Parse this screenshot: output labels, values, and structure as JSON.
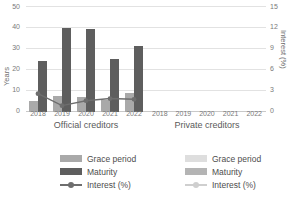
{
  "chart_data": {
    "type": "bar",
    "title": "",
    "subtitle": "",
    "xlabel": "",
    "ylabel": "Years",
    "y2label": "Interest (%)",
    "ylim": [
      0,
      50
    ],
    "y2lim": [
      0,
      15
    ],
    "yticks": [
      0,
      10,
      20,
      30,
      40,
      50
    ],
    "y2ticks": [
      0,
      3,
      6,
      9,
      12,
      15
    ],
    "grid": true,
    "legend_position": "bottom",
    "categories": [
      "2018",
      "2019",
      "2020",
      "2021",
      "2022"
    ],
    "panels": [
      {
        "name": "Official creditors",
        "categories": [
          "2018",
          "2019",
          "2020",
          "2021",
          "2022"
        ],
        "series": [
          {
            "name": "Grace period",
            "axis": "left",
            "unit": "Years",
            "values": [
              5.0,
              7.5,
              7.0,
              5.5,
              9.0
            ]
          },
          {
            "name": "Maturity",
            "axis": "left",
            "unit": "Years",
            "values": [
              24.0,
              39.5,
              39.0,
              25.0,
              31.0
            ]
          },
          {
            "name": "Interest (%)",
            "axis": "right",
            "unit": "%",
            "values": [
              2.6,
              0.9,
              1.6,
              1.9,
              1.8
            ]
          }
        ]
      },
      {
        "name": "Private creditors",
        "categories": [
          "2018",
          "2019",
          "2020",
          "2021",
          "2022"
        ],
        "series": [
          {
            "name": "Grace period",
            "axis": "left",
            "unit": "Years",
            "values": [
              0,
              0,
              0,
              0,
              0
            ]
          },
          {
            "name": "Maturity",
            "axis": "left",
            "unit": "Years",
            "values": [
              0,
              0,
              0,
              0,
              0
            ]
          },
          {
            "name": "Interest (%)",
            "axis": "right",
            "unit": "%",
            "values": [
              0,
              0,
              0,
              0,
              0
            ]
          }
        ]
      }
    ],
    "colors": {
      "grace_official": "#a9a9a9",
      "maturity_official": "#5e5e5e",
      "interest_official": "#6e6e6e",
      "grace_private": "#dedede",
      "maturity_private": "#b4b4b4",
      "interest_private": "#cfcfcf",
      "grid": "#e2e2e2",
      "text": "#595959"
    }
  },
  "axes": {
    "left_title": "Years",
    "right_title": "Interest (%)",
    "left_ticks": [
      "50",
      "40",
      "30",
      "20",
      "10",
      "0"
    ],
    "right_ticks": [
      "15",
      "12",
      "9",
      "6",
      "3",
      "0"
    ]
  },
  "panels": {
    "official": {
      "title": "Official creditors",
      "xticks": [
        "2018",
        "2019",
        "2020",
        "2021",
        "2022"
      ]
    },
    "private": {
      "title": "Private creditors",
      "xticks": [
        "2018",
        "2019",
        "2020",
        "2021",
        "2022"
      ]
    }
  },
  "legend": {
    "official": {
      "grace": "Grace period",
      "maturity": "Maturity",
      "interest": "Interest (%)"
    },
    "private": {
      "grace": "Grace period",
      "maturity": "Maturity",
      "interest": "Interest (%)"
    }
  }
}
